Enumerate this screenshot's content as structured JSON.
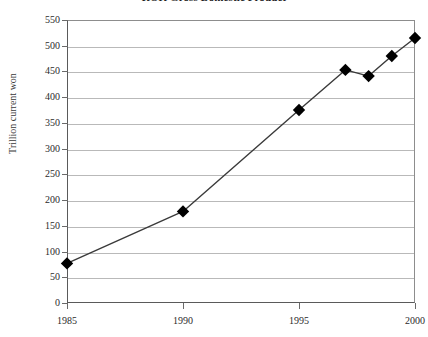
{
  "chart_data": {
    "type": "line",
    "title": "ROK Gross Domestic Product",
    "xlabel": "",
    "ylabel": "Trillion current won",
    "x": [
      1985,
      1990,
      1995,
      1997,
      1998,
      1999,
      2000
    ],
    "values": [
      77,
      178,
      375,
      453,
      441,
      480,
      515
    ],
    "series": [
      {
        "name": "ROK Gross Domestic Product",
        "values": [
          77,
          178,
          375,
          453,
          441,
          480,
          515
        ]
      }
    ],
    "xlim": [
      1985,
      2000
    ],
    "ylim": [
      0,
      550
    ],
    "ytick_labels": [
      "550",
      "500",
      "450",
      "400",
      "350",
      "300",
      "250",
      "200",
      "150",
      "100",
      "50",
      "0"
    ],
    "ytick_values": [
      550,
      500,
      450,
      400,
      350,
      300,
      250,
      200,
      150,
      100,
      50,
      0
    ],
    "xtick_labels": [
      "1985",
      "1990",
      "1995",
      "2000"
    ],
    "xtick_values": [
      1985,
      1990,
      1995,
      2000
    ],
    "grid": "horizontal",
    "legend": "none",
    "marker": "diamond",
    "marker_color": "#000000",
    "line_color": "#3a3a3a",
    "grid_color": "#b9b9b9",
    "axis_color": "#5a5a5a"
  }
}
